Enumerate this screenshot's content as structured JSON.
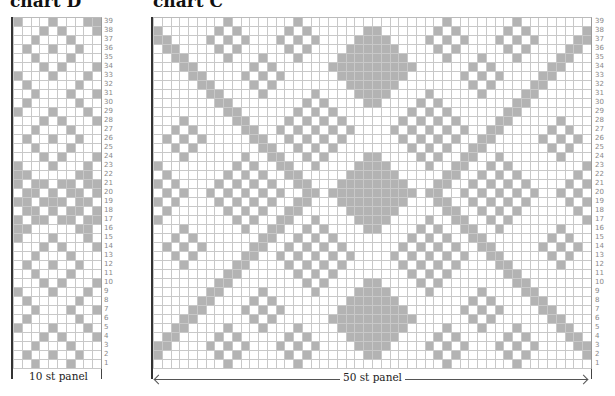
{
  "colors": {
    "filled": "#b3b3b3",
    "empty": "#ffffff",
    "gridline": "#c8c8c8",
    "rownum": "#888888"
  },
  "chartD": {
    "title": "chart D",
    "panel_label": "10 st panel",
    "stitches": 10,
    "rows_count": 39,
    "rows_top_to_bottom": [
      "1000100011",
      "0001010001",
      "0010001000",
      "0100100100",
      "0010001000",
      "0001010001",
      "1000100010",
      "0100000100",
      "0010001001",
      "0100000100",
      "1000100010",
      "0001010001",
      "0010001000",
      "0100100100",
      "0010001000",
      "0001010001",
      "1000100010",
      "1100000110",
      "1011011011",
      "0110101101",
      "1101110110",
      "0110101101",
      "1011011011",
      "1100000110",
      "1000100010",
      "0001010001",
      "0010001000",
      "0100100100",
      "0010001000",
      "0001010001",
      "1000100010",
      "0100000100",
      "0010001001",
      "0100000100",
      "1000100010",
      "0001010001",
      "0010001000",
      "0100100100",
      "0010001000",
      "0001010001",
      "1000100011"
    ]
  },
  "chartC": {
    "title": "chart C",
    "panel_label": "50 st panel",
    "stitches": 50,
    "rows_count": 39,
    "diagonal_bands": [
      {
        "start_row": 38,
        "start_col": 0,
        "dir_row": -1,
        "dir_col": 1,
        "width": 2,
        "length": 19
      },
      {
        "start_row": 2,
        "start_col": 0,
        "dir_row": 1,
        "dir_col": 1,
        "width": 2,
        "length": 19
      },
      {
        "start_row": 38,
        "start_col": 49,
        "dir_row": -1,
        "dir_col": -1,
        "width": 2,
        "length": 19
      },
      {
        "start_row": 2,
        "start_col": 49,
        "dir_row": 1,
        "dir_col": -1,
        "width": 2,
        "length": 19
      }
    ],
    "diamonds": [
      {
        "row": 37,
        "col": 8,
        "rings": [
          0,
          2
        ]
      },
      {
        "row": 37,
        "col": 16,
        "rings": [
          0,
          2
        ]
      },
      {
        "row": 37,
        "col": 33,
        "rings": [
          0,
          2
        ]
      },
      {
        "row": 37,
        "col": 41,
        "rings": [
          0,
          2
        ]
      },
      {
        "row": 3,
        "col": 8,
        "rings": [
          0,
          2
        ]
      },
      {
        "row": 3,
        "col": 16,
        "rings": [
          0,
          2
        ]
      },
      {
        "row": 3,
        "col": 33,
        "rings": [
          0,
          2
        ]
      },
      {
        "row": 3,
        "col": 41,
        "rings": [
          0,
          2
        ]
      },
      {
        "row": 33,
        "col": 12,
        "rings": [
          0,
          2
        ]
      },
      {
        "row": 33,
        "col": 37,
        "rings": [
          0,
          2
        ]
      },
      {
        "row": 7,
        "col": 12,
        "rings": [
          0,
          2
        ]
      },
      {
        "row": 7,
        "col": 37,
        "rings": [
          0,
          2
        ]
      },
      {
        "row": 34,
        "col": 24,
        "rings": [
          1,
          3,
          4
        ]
      },
      {
        "row": 34,
        "col": 25,
        "rings": [
          1,
          3,
          4
        ]
      },
      {
        "row": 6,
        "col": 24,
        "rings": [
          1,
          3,
          4
        ]
      },
      {
        "row": 6,
        "col": 25,
        "rings": [
          1,
          3,
          4
        ]
      },
      {
        "row": 27,
        "col": 18,
        "rings": [
          0,
          2,
          4
        ]
      },
      {
        "row": 27,
        "col": 31,
        "rings": [
          0,
          2,
          4
        ]
      },
      {
        "row": 13,
        "col": 18,
        "rings": [
          0,
          2,
          4
        ]
      },
      {
        "row": 13,
        "col": 31,
        "rings": [
          0,
          2,
          4
        ]
      },
      {
        "row": 20,
        "col": 10,
        "rings": [
          0,
          2,
          4
        ]
      },
      {
        "row": 20,
        "col": 24,
        "rings": [
          1,
          3,
          4
        ]
      },
      {
        "row": 20,
        "col": 25,
        "rings": [
          1,
          3,
          4
        ]
      },
      {
        "row": 20,
        "col": 39,
        "rings": [
          0,
          2,
          4
        ]
      },
      {
        "row": 26,
        "col": 3,
        "rings": [
          0,
          2
        ]
      },
      {
        "row": 26,
        "col": 46,
        "rings": [
          0,
          2
        ]
      },
      {
        "row": 14,
        "col": 3,
        "rings": [
          0,
          2
        ]
      },
      {
        "row": 14,
        "col": 46,
        "rings": [
          0,
          2
        ]
      },
      {
        "row": 20,
        "col": 0,
        "rings": [
          1,
          3
        ]
      },
      {
        "row": 20,
        "col": 49,
        "rings": [
          1,
          3
        ]
      }
    ]
  }
}
